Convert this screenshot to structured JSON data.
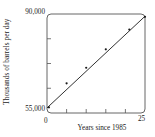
{
  "chart_data": {
    "type": "scatter",
    "title": "",
    "xlabel": "Years since 1985",
    "ylabel": "Thousands of barrels per day",
    "xlim": [
      0,
      25
    ],
    "ylim": [
      55000,
      90000
    ],
    "xticks": [
      0,
      25
    ],
    "xtick_labels": [
      "0",
      "25"
    ],
    "yticks": [
      55000,
      90000
    ],
    "ytick_labels": [
      "55,000",
      "90,000"
    ],
    "grid": false,
    "legend": null,
    "x": [
      0.5,
      5.0,
      10.0,
      15.0,
      21.0,
      25.0
    ],
    "y": [
      57000,
      65500,
      71000,
      77500,
      84500,
      89000
    ],
    "series": [
      {
        "name": "Observed production",
        "type": "scatter",
        "marker": "dot",
        "color": "#1a1a1a",
        "points": [
          {
            "x": 0.5,
            "y": 57000
          },
          {
            "x": 5.0,
            "y": 65500
          },
          {
            "x": 10.0,
            "y": 71000
          },
          {
            "x": 15.0,
            "y": 77500
          },
          {
            "x": 21.0,
            "y": 84500
          },
          {
            "x": 25.0,
            "y": 89000
          }
        ]
      },
      {
        "name": "Least-squares regression line",
        "type": "line",
        "color": "#1a1a1a",
        "endpoints": [
          {
            "x": 0.0,
            "y": 56800
          },
          {
            "x": 25.0,
            "y": 89200
          }
        ]
      }
    ]
  },
  "axes": {
    "y_title": "Thousands of barrels per day",
    "x_title": "Years since 1985",
    "y_top_tick": "90,000",
    "y_bottom_tick": "55,000",
    "x_left_tick": "0",
    "x_right_tick": "25"
  },
  "colors": {
    "axis": "#555555",
    "line": "#1a1a1a",
    "marker": "#1a1a1a",
    "background": "#ffffff",
    "text": "#1a1a1a"
  }
}
